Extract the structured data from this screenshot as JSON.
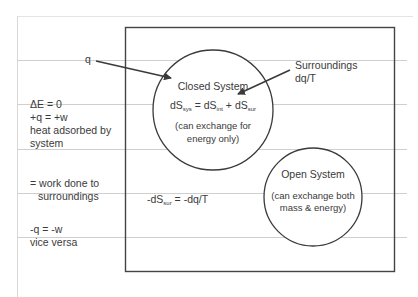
{
  "labels": {
    "q": "q",
    "surroundings": "Surroundings",
    "surroundings_flow": "dq/T",
    "closed_system": {
      "title": "Closed System",
      "eq_lhs": "dS",
      "eq_lhs_sub": "sys",
      "eq_mid": " = dS",
      "eq_mid_sub": "int",
      "eq_rhs": " + dS",
      "eq_rhs_sub": "sur",
      "note_line1": "(can exchange for",
      "note_line2": "energy only)"
    },
    "open_system": {
      "title": "Open System",
      "note_line1": "(can exchange both",
      "note_line2": "mass & energy)"
    },
    "entropy_surroundings": {
      "lhs": "-dS",
      "lhs_sub": "sur",
      "rhs": " = -dq/T"
    },
    "left_notes": {
      "line1": "ΔE = 0",
      "line2": "+q = +w",
      "line3": "heat adsorbed by",
      "line4": "system",
      "line5": "= work done to",
      "line6": "surroundings",
      "line7": "-q = -w",
      "line8": "vice versa"
    }
  },
  "colors": {
    "ink": "#3a3a3a",
    "rule": "#cfcfcf",
    "paper": "#ffffff"
  }
}
